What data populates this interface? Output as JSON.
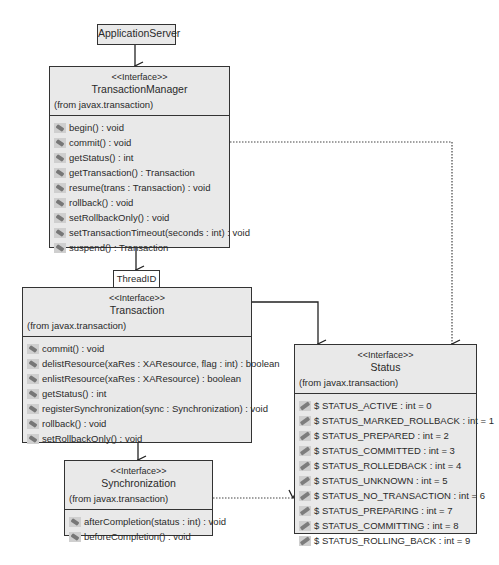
{
  "diagram": {
    "type": "UML class diagram",
    "nodes": {
      "application_server": {
        "name": "ApplicationServer"
      },
      "thread_id": {
        "name": "ThreadID"
      },
      "transaction_manager": {
        "stereotype": "<<Interface>>",
        "name": "TransactionManager",
        "package": "(from javax.transaction)",
        "operations": [
          "begin() : void",
          "commit() : void",
          "getStatus() : int",
          "getTransaction() : Transaction",
          "resume(trans : Transaction) : void",
          "rollback() : void",
          "setRollbackOnly() : void",
          "setTransactionTimeout(seconds : int) : void",
          "suspend() : Transaction"
        ]
      },
      "transaction": {
        "stereotype": "<<Interface>>",
        "name": "Transaction",
        "package": "(from javax.transaction)",
        "operations": [
          "commit() : void",
          "delistResource(xaRes : XAResource, flag : int) : boolean",
          "enlistResource(xaRes : XAResource) : boolean",
          "getStatus() : int",
          "registerSynchronization(sync : Synchronization) : void",
          "rollback() : void",
          "setRollbackOnly() : void"
        ]
      },
      "synchronization": {
        "stereotype": "<<Interface>>",
        "name": "Synchronization",
        "package": "(from javax.transaction)",
        "operations": [
          "afterCompletion(status : int) : void",
          "beforeCompletion() : void"
        ]
      },
      "status": {
        "stereotype": "<<Interface>>",
        "name": "Status",
        "package": "(from javax.transaction)",
        "attributes": [
          "$ STATUS_ACTIVE : int = 0",
          "$ STATUS_MARKED_ROLLBACK : int = 1",
          "$ STATUS_PREPARED : int = 2",
          "$ STATUS_COMMITTED : int = 3",
          "$ STATUS_ROLLEDBACK : int = 4",
          "$ STATUS_UNKNOWN : int = 5",
          "$ STATUS_NO_TRANSACTION : int = 6",
          "$ STATUS_PREPARING : int = 7",
          "$ STATUS_COMMITTING : int = 8",
          "$ STATUS_ROLLING_BACK : int = 9"
        ]
      }
    },
    "edges": [
      {
        "from": "ApplicationServer",
        "to": "TransactionManager",
        "style": "solid"
      },
      {
        "from": "TransactionManager",
        "to": "Transaction",
        "style": "solid",
        "qualifier": "ThreadID"
      },
      {
        "from": "TransactionManager",
        "to": "Status",
        "style": "dotted"
      },
      {
        "from": "Transaction",
        "to": "Status",
        "style": "solid"
      },
      {
        "from": "Transaction",
        "to": "Synchronization",
        "style": "solid"
      },
      {
        "from": "Synchronization",
        "to": "Status",
        "style": "dotted"
      }
    ],
    "colors": {
      "box_fill": "#e9e9e9",
      "border": "#333333",
      "line": "#222222"
    }
  }
}
